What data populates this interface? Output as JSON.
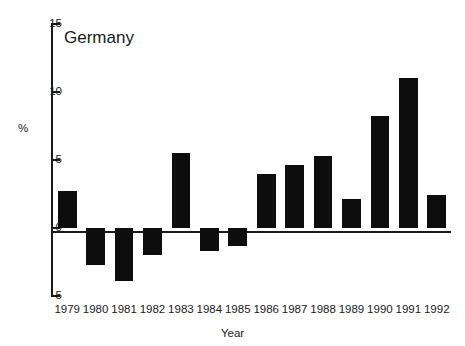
{
  "chart_data": {
    "type": "bar",
    "title": "Germany",
    "xlabel": "Year",
    "ylabel": "%",
    "categories": [
      "1979",
      "1980",
      "1981",
      "1982",
      "1983",
      "1984",
      "1985",
      "1986",
      "1987",
      "1988",
      "1989",
      "1990",
      "1991",
      "1992"
    ],
    "values": [
      2.7,
      -2.7,
      -3.9,
      -2.0,
      5.5,
      -1.7,
      -1.3,
      4.0,
      4.6,
      5.3,
      2.1,
      8.2,
      11.0,
      2.4
    ],
    "ylim": [
      -5,
      15
    ],
    "yticks": [
      15,
      10,
      5,
      0,
      -5
    ],
    "ytick_labels": [
      "15",
      "10",
      "5",
      "0",
      "-5"
    ],
    "grid": false,
    "legend": "none",
    "bar_color": "#0d0d0d",
    "axis_color": "#1a1a1a",
    "background_color": "#ffffff"
  }
}
